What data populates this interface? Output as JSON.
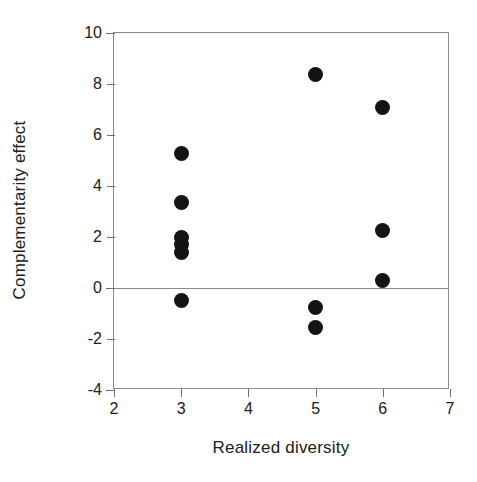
{
  "chart_data": {
    "type": "scatter",
    "title": "",
    "xlabel": "Realized diversity",
    "ylabel": "Complementarity effect",
    "xlim": [
      2,
      7
    ],
    "ylim": [
      -4,
      10
    ],
    "xticks": [
      2,
      3,
      4,
      5,
      6,
      7
    ],
    "yticks": [
      -4,
      -2,
      0,
      2,
      4,
      6,
      8,
      10
    ],
    "xtick_labels": [
      "2",
      "3",
      "4",
      "5",
      "6",
      "7"
    ],
    "ytick_labels": [
      "-4",
      "-2",
      "0",
      "2",
      "4",
      "6",
      "8",
      "10"
    ],
    "grid": false,
    "legend": null,
    "zero_line": 0,
    "marker": {
      "shape": "circle",
      "color": "#141414",
      "size_px": 15
    },
    "frame_color": "#8c8c8c",
    "background": "#ffffff",
    "points": [
      {
        "x": 3,
        "y": 5.27
      },
      {
        "x": 3,
        "y": 3.34
      },
      {
        "x": 3,
        "y": 2.0
      },
      {
        "x": 3,
        "y": 1.7
      },
      {
        "x": 3,
        "y": 1.4
      },
      {
        "x": 3,
        "y": -0.5
      },
      {
        "x": 5,
        "y": 8.38
      },
      {
        "x": 5,
        "y": -0.75
      },
      {
        "x": 5,
        "y": -1.55
      },
      {
        "x": 6,
        "y": 7.08
      },
      {
        "x": 6,
        "y": 2.25
      },
      {
        "x": 6,
        "y": 0.3
      }
    ]
  }
}
